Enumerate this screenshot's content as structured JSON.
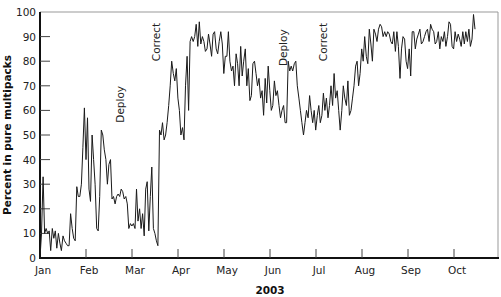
{
  "chart_data": {
    "type": "line",
    "title": "",
    "xlabel": "2003",
    "ylabel": "Percent in pure multipacks",
    "ylim": [
      0,
      100
    ],
    "yticks": [
      0,
      10,
      20,
      30,
      40,
      50,
      60,
      70,
      80,
      90,
      100
    ],
    "xticks": [
      "Jan",
      "Feb",
      "Mar",
      "Apr",
      "May",
      "Jun",
      "Jul",
      "Aug",
      "Sep",
      "Oct"
    ],
    "grid": false,
    "legend": null,
    "annotations": [
      {
        "label": "Deploy",
        "month_pos": 1.83,
        "y": 55
      },
      {
        "label": "Correct",
        "month_pos": 2.61,
        "y": 80
      },
      {
        "label": "Deploy",
        "month_pos": 5.37,
        "y": 78
      },
      {
        "label": "Correct",
        "month_pos": 6.24,
        "y": 80
      }
    ],
    "series": [
      {
        "name": "Percent in pure multipacks",
        "x_start_month": 0,
        "x_step_month": 0.0333,
        "values": [
          0,
          10,
          33,
          10,
          12,
          10,
          11,
          3,
          12,
          8,
          11,
          4,
          10,
          6,
          3,
          9,
          7,
          6,
          5,
          5,
          18,
          12,
          8,
          7,
          29,
          25,
          25,
          30,
          45,
          61,
          40,
          57,
          28,
          23,
          50,
          40,
          30,
          12,
          11,
          25,
          52,
          50,
          44,
          40,
          30,
          38,
          40,
          24,
          25,
          22,
          25,
          26,
          25,
          28,
          27,
          24,
          25,
          22,
          12,
          14,
          13,
          14,
          12,
          28,
          15,
          20,
          12,
          18,
          9,
          28,
          31,
          11,
          25,
          37,
          12,
          10,
          7,
          5,
          52,
          50,
          55,
          48,
          50,
          55,
          62,
          70,
          80,
          75,
          72,
          77,
          65,
          60,
          50,
          53,
          48,
          70,
          82,
          60,
          88,
          90,
          88,
          90,
          95,
          86,
          96,
          87,
          90,
          88,
          84,
          85,
          91,
          87,
          82,
          91,
          92,
          85,
          83,
          88,
          92,
          87,
          75,
          82,
          82,
          92,
          80,
          76,
          78,
          70,
          83,
          79,
          70,
          86,
          74,
          80,
          85,
          70,
          77,
          64,
          66,
          79,
          80,
          75,
          70,
          73,
          65,
          68,
          58,
          73,
          63,
          78,
          68,
          60,
          62,
          72,
          66,
          68,
          62,
          57,
          60,
          62,
          55,
          55,
          80,
          76,
          78,
          76,
          79,
          80,
          70,
          65,
          60,
          55,
          50,
          55,
          60,
          57,
          66,
          60,
          55,
          60,
          52,
          58,
          62,
          55,
          58,
          67,
          60,
          65,
          57,
          62,
          70,
          62,
          75,
          65,
          68,
          60,
          52,
          60,
          70,
          65,
          62,
          72,
          58,
          60,
          65,
          70,
          78,
          80,
          70,
          75,
          85,
          80,
          90,
          82,
          79,
          93,
          87,
          80,
          93,
          91,
          88,
          93,
          95,
          94,
          90,
          92,
          90,
          92,
          91,
          88,
          87,
          92,
          84,
          92,
          86,
          73,
          85,
          90,
          89,
          80,
          77,
          85,
          74,
          92,
          92,
          85,
          89,
          91,
          93,
          87,
          88,
          90,
          92,
          93,
          88,
          95,
          93,
          92,
          87,
          88,
          92,
          85,
          90,
          88,
          92,
          86,
          90,
          96,
          95,
          86,
          85,
          92,
          88,
          91,
          89,
          86,
          92,
          87,
          92,
          88,
          93,
          86,
          89,
          99,
          93
        ]
      }
    ]
  },
  "layout": {
    "plot_left": 40,
    "plot_right": 498,
    "plot_top": 12,
    "plot_bottom": 258,
    "month_px": 46.0,
    "line_color": "#1a1a1a",
    "axis_color": "#111111",
    "frame_color": "#999999"
  }
}
